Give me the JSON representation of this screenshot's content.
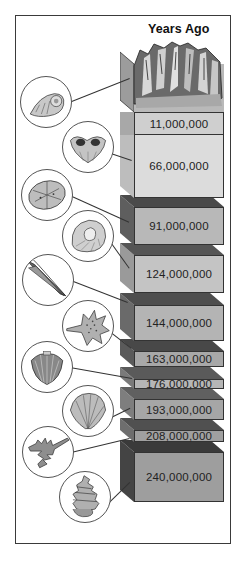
{
  "title": "Years Ago",
  "colors": {
    "frame": "#3a3a3a",
    "text": "#222222"
  },
  "layers": [
    {
      "label": "11,000,000",
      "front": "#cfcfcf",
      "side": "#a8a8a8",
      "top": "#8a8a8a",
      "y": 112,
      "h": 23
    },
    {
      "label": "66,000,000",
      "front": "#dcdcdc",
      "side": "#bdbdbd",
      "top": "#6e6e6e",
      "y": 122,
      "h": 76
    },
    {
      "label": "91,000,000",
      "front": "#b8b8b8",
      "side": "#5e5e5e",
      "top": "#4a4a4a",
      "y": 195,
      "h": 50
    },
    {
      "label": "124,000,000",
      "front": "#c4c4c4",
      "side": "#9a9a9a",
      "top": "#555555",
      "y": 243,
      "h": 50
    },
    {
      "label": "144,000,000",
      "front": "#b4b4b4",
      "side": "#6a6a6a",
      "top": "#4e4e4e",
      "y": 293,
      "h": 48
    },
    {
      "label": "163,000,000",
      "front": "#a8a8a8",
      "side": "#5a5a5a",
      "top": "#484848",
      "y": 339,
      "h": 28
    },
    {
      "label": "176,000,000",
      "front": "#b6b6b6",
      "side": "#7a7a7a",
      "top": "#5a5a5a",
      "y": 367,
      "h": 22
    },
    {
      "label": "193,000,000",
      "front": "#a6a6a6",
      "side": "#7e7e7e",
      "top": "#606060",
      "y": 387,
      "h": 33
    },
    {
      "label": "208,000,000",
      "front": "#a0a0a0",
      "side": "#6e6e6e",
      "top": "#505050",
      "y": 418,
      "h": 24
    },
    {
      "label": "240,000,000",
      "front": "#9e9e9e",
      "side": "#444444",
      "top": "#3a3a3a",
      "y": 440,
      "h": 62
    }
  ],
  "fossils": [
    {
      "name": "ammonite-fossil",
      "cx": 46,
      "cy": 102,
      "r": 26
    },
    {
      "name": "brachiopod-fossil",
      "cx": 88,
      "cy": 147,
      "r": 26
    },
    {
      "name": "sea-urchin-fossil",
      "cx": 47,
      "cy": 195,
      "r": 26
    },
    {
      "name": "nautilus-fossil",
      "cx": 88,
      "cy": 236,
      "r": 26
    },
    {
      "name": "belemnite-fossil",
      "cx": 48,
      "cy": 280,
      "r": 26
    },
    {
      "name": "spiny-shell-fossil",
      "cx": 88,
      "cy": 326,
      "r": 26
    },
    {
      "name": "fan-shell-fossil",
      "cx": 47,
      "cy": 367,
      "r": 26
    },
    {
      "name": "scallop-fossil",
      "cx": 88,
      "cy": 411,
      "r": 26
    },
    {
      "name": "branching-coral-fossil",
      "cx": 48,
      "cy": 452,
      "r": 26
    },
    {
      "name": "spiral-gastropod-fossil",
      "cx": 85,
      "cy": 497,
      "r": 26
    }
  ]
}
